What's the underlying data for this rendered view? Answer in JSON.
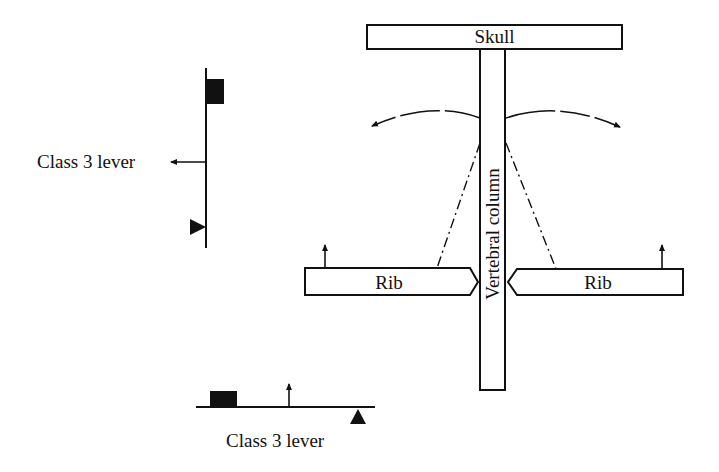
{
  "diagram": {
    "type": "anatomical lever diagram",
    "labels": {
      "skull": "Skull",
      "vertebral_column": "Vertebral column",
      "rib_left": "Rib",
      "rib_right": "Rib",
      "lever_left": "Class 3 lever",
      "lever_bottom": "Class 3 lever"
    },
    "colors": {
      "stroke": "#111111",
      "fill": "#ffffff",
      "weight": "#111111"
    }
  }
}
